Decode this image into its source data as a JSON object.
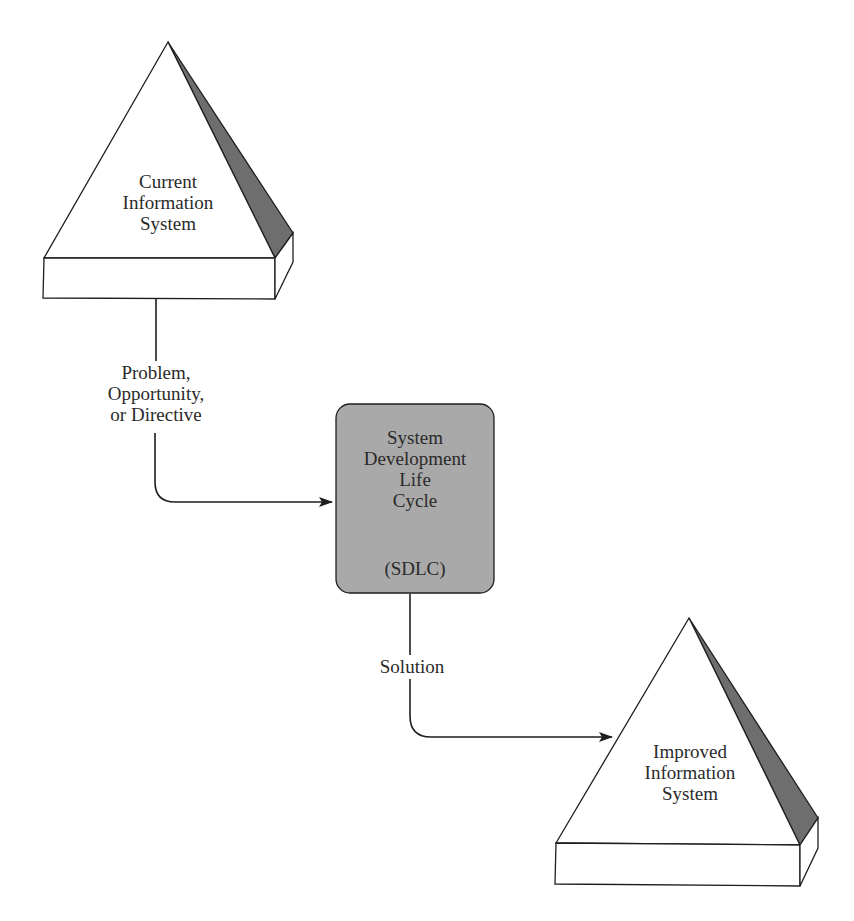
{
  "diagram": {
    "type": "flow",
    "nodes": {
      "current_system": {
        "lines": [
          "Current",
          "Information",
          "System"
        ],
        "shape": "pyramid"
      },
      "sdlc": {
        "lines": [
          "System",
          "Development",
          "Life",
          "Cycle"
        ],
        "abbreviation": "(SDLC)",
        "shape": "rounded-box",
        "fill": "#a9a9a9"
      },
      "improved_system": {
        "lines": [
          "Improved",
          "Information",
          "System"
        ],
        "shape": "pyramid"
      }
    },
    "edges": {
      "input": {
        "from": "current_system",
        "to": "sdlc",
        "lines": [
          "Problem,",
          "Opportunity,",
          "or Directive"
        ]
      },
      "output": {
        "from": "sdlc",
        "to": "improved_system",
        "label": "Solution"
      }
    },
    "colors": {
      "stroke": "#1e1e1e",
      "shade": "#6e6e6e",
      "box_fill": "#a9a9a9"
    }
  }
}
